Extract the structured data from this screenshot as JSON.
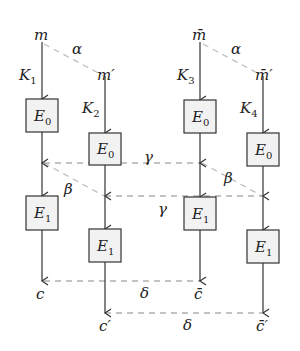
{
  "diagram": {
    "columns": [
      {
        "start": "m",
        "key_letter": "K",
        "key_index": "1",
        "enc0": "E",
        "enc0_index": "0",
        "enc1": "E",
        "enc1_index": "1",
        "end": "c"
      },
      {
        "start": "m′",
        "key_letter": "K",
        "key_index": "2",
        "enc0": "E",
        "enc0_index": "0",
        "enc1": "E",
        "enc1_index": "1",
        "end": "c′"
      },
      {
        "start": "m̄",
        "key_letter": "K",
        "key_index": "3",
        "enc0": "E",
        "enc0_index": "0",
        "enc1": "E",
        "enc1_index": "1",
        "end": "c̄"
      },
      {
        "start": "m̄′",
        "key_letter": "K",
        "key_index": "4",
        "enc0": "E",
        "enc0_index": "0",
        "enc1": "E",
        "enc1_index": "1",
        "end": "c̄′"
      }
    ],
    "relations": {
      "alpha_left": "α",
      "alpha_right": "α",
      "beta_left": "β",
      "beta_right": "β",
      "gamma_top": "γ",
      "gamma_bottom": "γ",
      "delta_top": "δ",
      "delta_bottom": "δ"
    }
  }
}
